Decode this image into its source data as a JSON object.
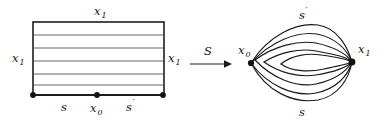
{
  "figure": {
    "background_color": "#ffffff",
    "ink_color": "#1a1a1a",
    "leaf_color": "#4a4a4a",
    "width": 382,
    "height": 122
  },
  "left_panel": {
    "name": "foliated-square",
    "shape": "rectangle",
    "bounds": {
      "x": 33,
      "y": 22,
      "width": 131,
      "height": 73
    },
    "labels": {
      "top": "x",
      "top_sub": "1",
      "left": "x",
      "left_sub": "1",
      "right": "x",
      "right_sub": "1",
      "bottom_left_segment": "s",
      "bottom_mid": "x",
      "bottom_mid_sub": "0",
      "bottom_right_segment": "s",
      "bottom_right_prime": "′"
    },
    "interior_leaf_count": 4,
    "leaf_y_positions": [
      35,
      48,
      61,
      74,
      84
    ],
    "vertices": [
      {
        "name": "bottom-left-vertex",
        "x": 33,
        "y": 95
      },
      {
        "name": "bottom-mid-vertex",
        "x": 97,
        "y": 95
      },
      {
        "name": "bottom-right-vertex",
        "x": 163,
        "y": 95
      }
    ]
  },
  "arrow": {
    "name": "map-arrow",
    "label": "S",
    "from_x": 190,
    "to_x": 228,
    "y": 64
  },
  "right_panel": {
    "name": "bouquet-graph",
    "labels": {
      "left_vertex": "x",
      "left_vertex_sub": "0",
      "right_vertex": "x",
      "right_vertex_sub": "1",
      "top_edge": "s",
      "top_edge_prime": "′",
      "bottom_edge": "s"
    },
    "vertices": [
      {
        "name": "x0-vertex",
        "x": 251,
        "y": 63
      },
      {
        "name": "x1-vertex",
        "x": 352,
        "y": 62
      }
    ],
    "edge_count": 6
  }
}
